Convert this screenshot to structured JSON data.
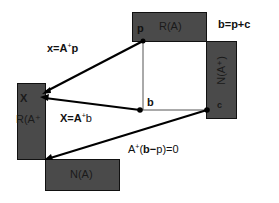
{
  "diagram": {
    "boxes": {
      "range_A": {
        "label": "R(A)",
        "point_label": "p"
      },
      "null_A_plus": {
        "label": "N(A⁺)",
        "point_label": "c"
      },
      "range_A_plus": {
        "label": "R(A⁺",
        "point_label": "X"
      },
      "null_A": {
        "label": "N(A)"
      }
    },
    "points": {
      "b": "b"
    },
    "equations": {
      "b_decomp": "b=p+c",
      "x_from_p_lhs": "x=A",
      "x_from_p_sup": "+",
      "x_from_p_rhs": "p",
      "x_from_b_lhs": "X=A",
      "x_from_b_sup": "+",
      "x_from_b_rhs": "b",
      "orth_lhs": "A",
      "orth_sup": "+",
      "orth_paren_open": "(",
      "orth_b": "b",
      "orth_minus": "−",
      "orth_p": "p",
      "orth_rhs": ")=0"
    },
    "colors": {
      "box_fill": "#4a4a4a",
      "box_border": "#111111",
      "line": "#000000",
      "thin_line": "#555555",
      "background": "#ffffff"
    }
  }
}
